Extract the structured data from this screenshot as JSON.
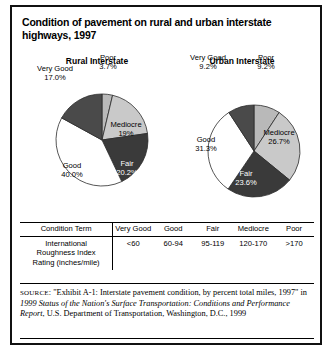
{
  "figure": {
    "title": "Condition of pavement on rural and urban interstate highways, 1997"
  },
  "chart_data": [
    {
      "type": "pie",
      "title": "Rural Interstate",
      "categories": [
        "Poor",
        "Mediocre",
        "Fair",
        "Good",
        "Very Good"
      ],
      "values": [
        3.7,
        19.0,
        20.2,
        40.0,
        17.0
      ],
      "value_labels": [
        "3.7%",
        "19%",
        "20.2%",
        "40.0%",
        "17.0%"
      ],
      "colors": [
        "#b9b9b9",
        "#c9c9c9",
        "#3a3a3a",
        "#ffffff",
        "#4a4a4a"
      ],
      "label_text_colors": [
        "#000000",
        "#000000",
        "#ffffff",
        "#000000",
        "#000000"
      ],
      "unit": "percent of total miles",
      "legend": "none"
    },
    {
      "type": "pie",
      "title": "Urban Interstate",
      "categories": [
        "Poor",
        "Mediocre",
        "Fair",
        "Good",
        "Very Good"
      ],
      "values": [
        9.2,
        26.7,
        23.6,
        31.3,
        9.2
      ],
      "value_labels": [
        "9.2%",
        "26.7%",
        "23.6%",
        "31.3%",
        "9.2%"
      ],
      "colors": [
        "#b9b9b9",
        "#c9c9c9",
        "#3a3a3a",
        "#ffffff",
        "#4a4a4a"
      ],
      "label_text_colors": [
        "#000000",
        "#000000",
        "#ffffff",
        "#000000",
        "#000000"
      ],
      "unit": "percent of total miles",
      "legend": "none"
    }
  ],
  "table": {
    "headers": [
      "Condition Term",
      "Very Good",
      "Good",
      "Fair",
      "Mediocre",
      "Poor"
    ],
    "row_label": "International Roughness Index Rating (inches/mile)",
    "row_label_lines": [
      "International",
      "Roughness Index",
      "Rating (inches/mile)"
    ],
    "values": [
      "<60",
      "60-94",
      "95-119",
      "120-170",
      ">170"
    ]
  },
  "source": {
    "label": "SOURCE",
    "text_1": ": \"Exhibit A-1: Interstate pavement condition, by percent total miles, 1997\" in ",
    "italic_1": "1999 Status of the Nation's Surface Transportation: Conditions and Performance Report",
    "text_2": ", U.S. Department of Transportation, Washington, D.C., 1999"
  }
}
